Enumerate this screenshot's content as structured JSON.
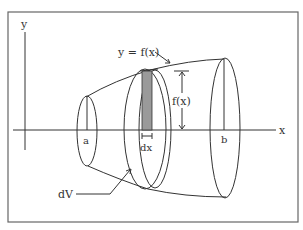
{
  "diagram": {
    "labels": {
      "y_axis": "y",
      "x_axis": "x",
      "curve": "y = f(x)",
      "height": "f(x)",
      "a": "a",
      "b": "b",
      "dx": "dx",
      "dV": "dV"
    },
    "colors": {
      "line": "#333333",
      "slice_fill": "#9a9a9a",
      "frame": "#555555",
      "background": "#ffffff"
    }
  }
}
